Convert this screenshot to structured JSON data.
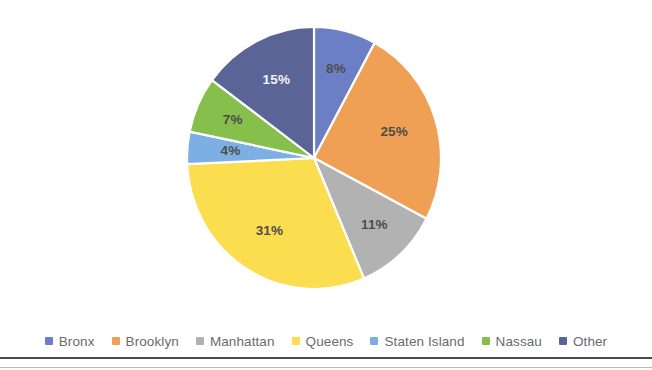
{
  "chart_data": {
    "type": "pie",
    "title": "",
    "subtitle": "",
    "xlabel": "",
    "ylabel": "",
    "grid": false,
    "legend_position": "bottom",
    "value_unit": "percent",
    "start_angle_deg": 0,
    "direction": "clockwise",
    "categories": [
      "Bronx",
      "Brooklyn",
      "Manhattan",
      "Queens",
      "Staten Island",
      "Nassau",
      "Other"
    ],
    "values": [
      8,
      25,
      11,
      31,
      4,
      7,
      15
    ],
    "data_labels": [
      "8%",
      "25%",
      "11%",
      "31%",
      "4%",
      "7%",
      "15%"
    ],
    "colors": [
      "#6d7fc4",
      "#f0a054",
      "#b2b2b2",
      "#fade4f",
      "#7cb0e2",
      "#86bf4c",
      "#5a6496"
    ],
    "label_contrast": [
      "dark",
      "dark",
      "dark",
      "dark",
      "dark",
      "dark",
      "light"
    ],
    "slices": [
      {
        "label": "Bronx",
        "value": 8,
        "display": "8%",
        "color": "#6d7fc4",
        "text": "dark"
      },
      {
        "label": "Brooklyn",
        "value": 25,
        "display": "25%",
        "color": "#f0a054",
        "text": "dark"
      },
      {
        "label": "Manhattan",
        "value": 11,
        "display": "11%",
        "color": "#b2b2b2",
        "text": "dark"
      },
      {
        "label": "Queens",
        "value": 31,
        "display": "31%",
        "color": "#fade4f",
        "text": "dark"
      },
      {
        "label": "Staten Island",
        "value": 4,
        "display": "4%",
        "color": "#7cb0e2",
        "text": "dark"
      },
      {
        "label": "Nassau",
        "value": 7,
        "display": "7%",
        "color": "#86bf4c",
        "text": "dark"
      },
      {
        "label": "Other",
        "value": 15,
        "display": "15%",
        "color": "#5a6496",
        "text": "light"
      }
    ]
  },
  "legend": {
    "items": [
      {
        "label": "Bronx",
        "color": "#6d7fc4"
      },
      {
        "label": "Brooklyn",
        "color": "#f0a054"
      },
      {
        "label": "Manhattan",
        "color": "#b2b2b2"
      },
      {
        "label": "Queens",
        "color": "#fade4f"
      },
      {
        "label": "Staten Island",
        "color": "#7cb0e2"
      },
      {
        "label": "Nassau",
        "color": "#86bf4c"
      },
      {
        "label": "Other",
        "color": "#5a6496"
      }
    ]
  }
}
